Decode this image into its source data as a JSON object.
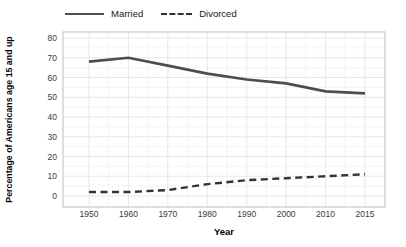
{
  "chart_data": {
    "type": "line",
    "title": "",
    "xlabel": "Year",
    "ylabel": "Percentage of Americans age 15 and up",
    "categories": [
      "1950",
      "1960",
      "1970",
      "1980",
      "1990",
      "2000",
      "2010",
      "2015"
    ],
    "y_ticks": [
      0,
      10,
      20,
      30,
      40,
      50,
      60,
      70,
      80
    ],
    "ylim": [
      0,
      80
    ],
    "grid": "major and minor gridlines, light gray, white background, gray panel border",
    "legend_position": "top",
    "series": [
      {
        "name": "Married",
        "style": "solid",
        "color": "#4d4d4d",
        "values": [
          68,
          70,
          66,
          62,
          59,
          57,
          53,
          52
        ]
      },
      {
        "name": "Divorced",
        "style": "dashed",
        "color": "#333333",
        "values": [
          2,
          2,
          3,
          6,
          8,
          9,
          10,
          11
        ]
      }
    ]
  },
  "colors": {
    "background": "#ffffff",
    "panel_border": "#c9c9c9",
    "grid_major": "#e7e7e7",
    "grid_minor": "#f4f4f4",
    "tick_text": "#3b3b3b",
    "axis_title_text": "#000000"
  }
}
